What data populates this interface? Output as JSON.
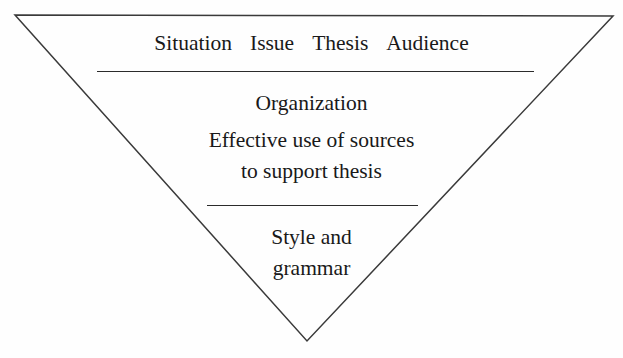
{
  "diagram": {
    "type": "inverted-triangle-hierarchy",
    "shape": {
      "name": "inverted-triangle",
      "vertices": [
        [
          15,
          15
        ],
        [
          613,
          16
        ],
        [
          307,
          341
        ]
      ],
      "stroke_color": "#3a3a3a",
      "stroke_width": 1.5,
      "fill": "none"
    },
    "background_color": "#fefefe",
    "text_color": "#191919",
    "dividers": [
      {
        "name": "divider-top",
        "x1": 97,
        "x2": 534,
        "y": 71,
        "color": "#2b2b2b"
      },
      {
        "name": "divider-bottom",
        "x1": 207,
        "x2": 418,
        "y": 205,
        "color": "#2b2b2b"
      }
    ],
    "tiers": [
      {
        "id": "tier-1",
        "criteria": [
          "Situation",
          "Issue",
          "Thesis",
          "Audience"
        ]
      },
      {
        "id": "tier-2",
        "lines": [
          "Organization",
          "Effective use of sources",
          "to support thesis"
        ]
      },
      {
        "id": "tier-3",
        "lines": [
          "Style and",
          "grammar"
        ]
      }
    ]
  }
}
